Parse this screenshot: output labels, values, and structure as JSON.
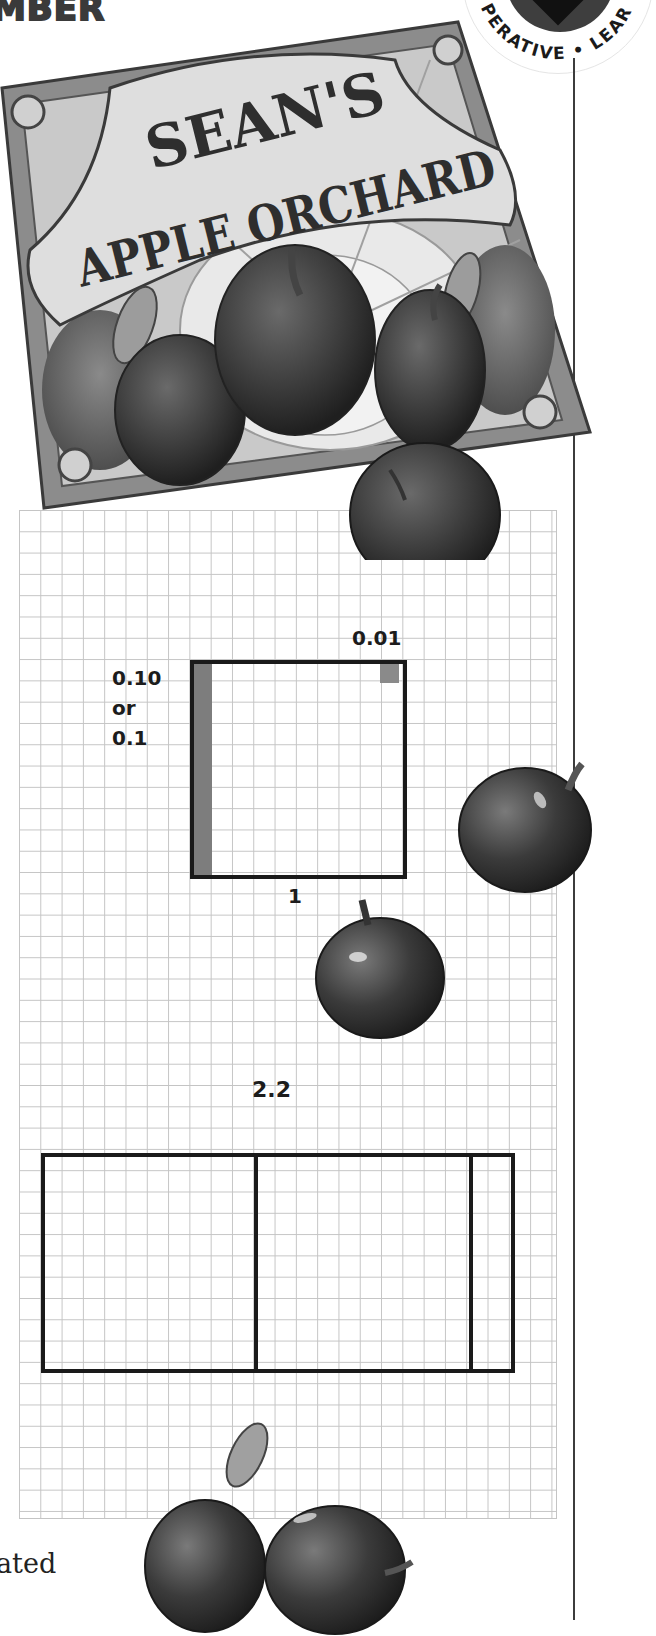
{
  "header": {
    "partial_word": "MBER"
  },
  "badge": {
    "visible_text": "PERATIVE • LEAR",
    "fill_color": "#3e3e3e"
  },
  "sign": {
    "line1": "SEAN'S",
    "line2": "APPLE ORCHARD",
    "board_color": "#a8a8a8",
    "frame_color": "#8c8c8c"
  },
  "model_one": {
    "hundredth_label": "0.01",
    "tenth_label_line1": "0.10",
    "tenth_label_line2": "or",
    "tenth_label_line3": "0.1",
    "whole_label": "1",
    "strip_color": "#7d7d7d"
  },
  "model_two": {
    "value_label": "2.2",
    "wholes": 2,
    "tenths": 2
  },
  "footer": {
    "partial_text": "ated"
  },
  "colors": {
    "grid_line": "#c4c4c4",
    "outline": "#1a1a1a",
    "apple": "#3a3a3a"
  }
}
